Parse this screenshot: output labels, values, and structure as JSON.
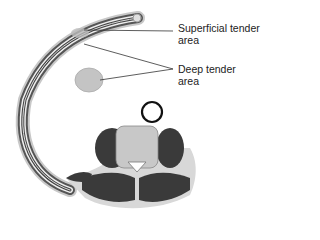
{
  "diagram": {
    "type": "anatomical cross-section",
    "labels": {
      "superficial": [
        "Superficial tender",
        "area"
      ],
      "deep": [
        "Deep tender",
        "area"
      ]
    },
    "colors": {
      "line": "#333333",
      "muscle": "#3a3a3a",
      "bone": "#bdbdbd",
      "tissue": "#d8d8d8",
      "marker": "#111111"
    }
  }
}
